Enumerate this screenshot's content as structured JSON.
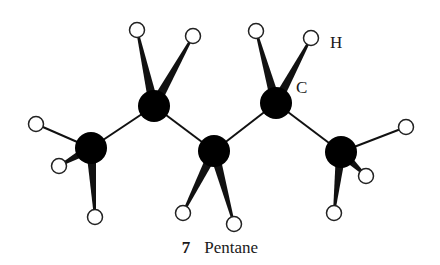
{
  "figure": {
    "number": "7",
    "title": "Pentane",
    "labels": {
      "hydrogen": "H",
      "carbon": "C"
    },
    "colors": {
      "carbon": "#000000",
      "hydrogen_fill": "#ffffff",
      "hydrogen_stroke": "#222222",
      "bond": "#111111"
    },
    "carbons": [
      {
        "x": 91,
        "y": 148
      },
      {
        "x": 154,
        "y": 106
      },
      {
        "x": 214,
        "y": 151
      },
      {
        "x": 276,
        "y": 103
      },
      {
        "x": 341,
        "y": 152
      }
    ],
    "hydrogens": [
      {
        "x": 36,
        "y": 124,
        "c": 0,
        "wedge": false
      },
      {
        "x": 59,
        "y": 166,
        "c": 0,
        "wedge": true
      },
      {
        "x": 95,
        "y": 217,
        "c": 0,
        "wedge": true
      },
      {
        "x": 137,
        "y": 30,
        "c": 1,
        "wedge": true
      },
      {
        "x": 193,
        "y": 36,
        "c": 1,
        "wedge": true
      },
      {
        "x": 183,
        "y": 213,
        "c": 2,
        "wedge": true
      },
      {
        "x": 234,
        "y": 224,
        "c": 2,
        "wedge": true
      },
      {
        "x": 256,
        "y": 31,
        "c": 3,
        "wedge": true
      },
      {
        "x": 311,
        "y": 38,
        "c": 3,
        "wedge": true
      },
      {
        "x": 406,
        "y": 127,
        "c": 4,
        "wedge": false
      },
      {
        "x": 366,
        "y": 176,
        "c": 4,
        "wedge": true
      },
      {
        "x": 334,
        "y": 213,
        "c": 4,
        "wedge": true
      }
    ]
  }
}
